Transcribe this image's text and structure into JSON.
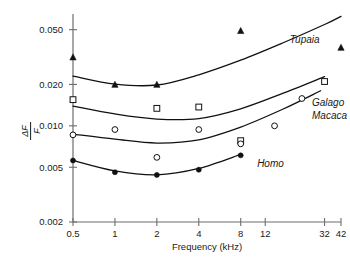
{
  "chart_data": {
    "type": "scatter",
    "title": "",
    "subtitle": "",
    "xlabel": "Frequency (kHz)",
    "ylabel": "ΔF/F",
    "ylabel_numerator": "ΔF",
    "ylabel_denominator": "F",
    "xscale": "log",
    "yscale": "log",
    "grid": false,
    "legend": "inline-curve-labels",
    "xlim": [
      0.5,
      42
    ],
    "ylim": [
      0.002,
      0.065
    ],
    "xticks": [
      0.5,
      1,
      2,
      4,
      8,
      12,
      32,
      42
    ],
    "xtick_labels": [
      "0.5",
      "1",
      "2",
      "4",
      "8",
      "12",
      "32",
      "42"
    ],
    "yticks": [
      0.002,
      0.005,
      0.01,
      0.02,
      0.05
    ],
    "ytick_labels": [
      "0.002",
      "0.005",
      "0.010",
      "0.020",
      "0.050"
    ],
    "series": [
      {
        "name": "Tupaia",
        "marker": "filled-triangle",
        "color": "#111111",
        "label": "Tupaia",
        "points": [
          {
            "x": 0.5,
            "y": 0.0315
          },
          {
            "x": 1.0,
            "y": 0.0199
          },
          {
            "x": 2.0,
            "y": 0.0199
          },
          {
            "x": 8.0,
            "y": 0.049
          },
          {
            "x": 42.0,
            "y": 0.037
          }
        ],
        "curve": [
          {
            "x": 0.5,
            "y": 0.023
          },
          {
            "x": 1.0,
            "y": 0.0201
          },
          {
            "x": 2.0,
            "y": 0.0198
          },
          {
            "x": 4.0,
            "y": 0.0235
          },
          {
            "x": 8.0,
            "y": 0.03
          },
          {
            "x": 16.0,
            "y": 0.04
          },
          {
            "x": 32.0,
            "y": 0.0545
          },
          {
            "x": 42.0,
            "y": 0.0625
          }
        ]
      },
      {
        "name": "Galago",
        "marker": "open-square",
        "color": "#111111",
        "label": "Galago",
        "points": [
          {
            "x": 0.5,
            "y": 0.0155
          },
          {
            "x": 2.0,
            "y": 0.0134
          },
          {
            "x": 4.0,
            "y": 0.0137
          },
          {
            "x": 8.0,
            "y": 0.0078
          },
          {
            "x": 32.0,
            "y": 0.021
          }
        ],
        "curve": [
          {
            "x": 0.5,
            "y": 0.0139
          },
          {
            "x": 1.0,
            "y": 0.0122
          },
          {
            "x": 2.0,
            "y": 0.0112
          },
          {
            "x": 4.0,
            "y": 0.0113
          },
          {
            "x": 8.0,
            "y": 0.0133
          },
          {
            "x": 16.0,
            "y": 0.0172
          },
          {
            "x": 32.0,
            "y": 0.0228
          }
        ]
      },
      {
        "name": "Macaca",
        "marker": "open-circle",
        "color": "#111111",
        "label": "Macaca",
        "points": [
          {
            "x": 0.5,
            "y": 0.0086
          },
          {
            "x": 1.0,
            "y": 0.0094
          },
          {
            "x": 2.0,
            "y": 0.0059
          },
          {
            "x": 4.0,
            "y": 0.0094
          },
          {
            "x": 8.0,
            "y": 0.0074
          },
          {
            "x": 14.0,
            "y": 0.01
          },
          {
            "x": 22.0,
            "y": 0.0158
          }
        ],
        "curve": [
          {
            "x": 0.5,
            "y": 0.0087
          },
          {
            "x": 1.0,
            "y": 0.008
          },
          {
            "x": 2.0,
            "y": 0.0075
          },
          {
            "x": 4.0,
            "y": 0.0079
          },
          {
            "x": 8.0,
            "y": 0.0098
          },
          {
            "x": 16.0,
            "y": 0.0132
          },
          {
            "x": 30.0,
            "y": 0.018
          }
        ]
      },
      {
        "name": "Homo",
        "marker": "filled-circle",
        "color": "#111111",
        "label": "Homo",
        "points": [
          {
            "x": 0.5,
            "y": 0.0056
          },
          {
            "x": 1.0,
            "y": 0.0046
          },
          {
            "x": 2.0,
            "y": 0.0044
          },
          {
            "x": 4.0,
            "y": 0.0048
          },
          {
            "x": 8.0,
            "y": 0.0061
          }
        ],
        "curve": [
          {
            "x": 0.5,
            "y": 0.0056
          },
          {
            "x": 1.0,
            "y": 0.0047
          },
          {
            "x": 2.0,
            "y": 0.0044
          },
          {
            "x": 4.0,
            "y": 0.0049
          },
          {
            "x": 8.0,
            "y": 0.0062
          }
        ]
      }
    ],
    "annotations": [
      {
        "text": "Tupaia",
        "x": 18.0,
        "y": 0.04
      },
      {
        "text": "Galago",
        "x": 26.0,
        "y": 0.014
      },
      {
        "text": "Macaca",
        "x": 26.0,
        "y": 0.0113
      },
      {
        "text": "Homo",
        "x": 10.5,
        "y": 0.005
      }
    ]
  },
  "axis": {
    "x_title": "Frequency (kHz)",
    "y_title_numerator": "ΔF",
    "y_title_denominator": "F"
  }
}
